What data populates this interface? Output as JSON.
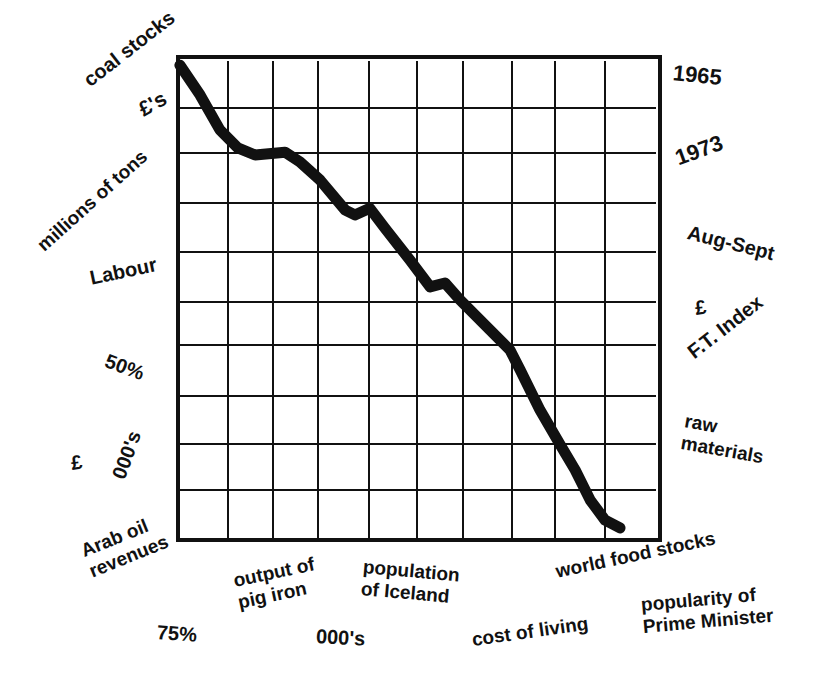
{
  "chart_data": {
    "type": "line",
    "title": "",
    "xlabel": "",
    "ylabel": "",
    "grid": true,
    "legend": null,
    "plot_box_px": {
      "left": 178,
      "top": 57,
      "right": 660,
      "bottom": 540
    },
    "grid_px": {
      "vertical": [
        228,
        273,
        318,
        369,
        417,
        463,
        512,
        555,
        605
      ],
      "horizontal": [
        108,
        153,
        203,
        252,
        302,
        345,
        396,
        444,
        490
      ]
    },
    "xlim": [
      0,
      10
    ],
    "ylim": [
      0,
      10
    ],
    "series": [
      {
        "name": "everything",
        "description": "Single thick line descending steadily from top-left to bottom-right with small bumps",
        "x": [
          0.04,
          0.46,
          0.87,
          1.24,
          1.6,
          2.22,
          2.53,
          2.95,
          3.47,
          3.67,
          3.98,
          4.29,
          4.81,
          5.23,
          5.54,
          5.85,
          6.47,
          6.89,
          7.1,
          7.51,
          7.93,
          8.24,
          8.55,
          8.86,
          9.17
        ],
        "y": [
          9.83,
          9.21,
          8.49,
          8.12,
          7.97,
          8.03,
          7.83,
          7.45,
          6.83,
          6.73,
          6.87,
          6.46,
          5.8,
          5.24,
          5.32,
          4.97,
          4.35,
          3.93,
          3.52,
          2.69,
          1.97,
          1.45,
          0.83,
          0.41,
          0.25
        ]
      }
    ],
    "left_labels": [
      "coal stocks",
      "£'s",
      "millions of tons",
      "Labour",
      "50%",
      "£",
      "000's",
      "Arab oil revenues"
    ],
    "right_labels": [
      "1965",
      "1973",
      "Aug-Sept",
      "£",
      "F.T. Index",
      "raw materials"
    ],
    "bottom_labels": [
      "output of pig iron",
      "population of Iceland",
      "world food stocks",
      "75%",
      "000's",
      "cost of living",
      "popularity of Prime Minister"
    ]
  },
  "labels": {
    "coal_stocks": "coal stocks",
    "pounds_s": "£'s",
    "millions_of_tons": "millions of tons",
    "labour": "Labour",
    "fifty_pct": "50%",
    "pound_left": "£",
    "thousands_left": "000's",
    "arab_oil": "Arab oil\nrevenues",
    "y1965": "1965",
    "y1973": "1973",
    "aug_sept": "Aug-Sept",
    "pound_right": "£",
    "ft_index": "F.T. Index",
    "raw_materials": "raw\nmaterials",
    "pig_iron": "output of\npig iron",
    "iceland": "population\nof Iceland",
    "world_food": "world food stocks",
    "seventy_five": "75%",
    "thousands_bottom": "000's",
    "cost_of_living": "cost of living",
    "pm_popularity": "popularity of\nPrime Minister"
  },
  "colors": {
    "ink": "#111111",
    "background": "#ffffff"
  }
}
